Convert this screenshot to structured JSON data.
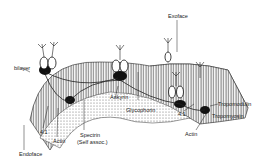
{
  "diagram": {
    "labels": {
      "bilayer": "bilayer",
      "exoface": "Exoface",
      "endoface": "Endoface",
      "band41_left": "4.1",
      "actin_left": "Actin",
      "spectrin": "Spectrin",
      "spectrin_note": "(Self assoc.)",
      "ankyrin": "Ankyrin",
      "glycophorin": "Glycophorin",
      "tropomodulin": "Tropomodulin",
      "band41_right": "4.1",
      "tropomyosin": "Tropomyosin",
      "actin_right": "Actin"
    },
    "protein_numbers": [
      "2",
      "3",
      "3",
      "3"
    ]
  }
}
